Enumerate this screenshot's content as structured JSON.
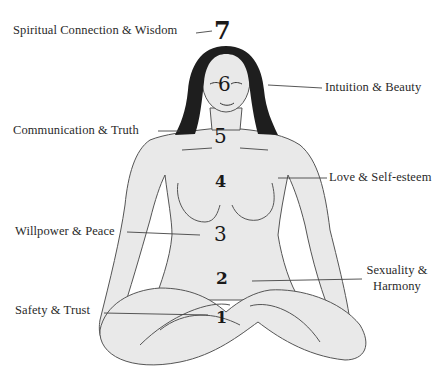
{
  "diagram": {
    "type": "chakra-body-map",
    "colors": {
      "background": "#ffffff",
      "skin": "#e9e9e9",
      "outline": "#555555",
      "hair": "#1e1e1e",
      "text": "#2a2a2a"
    },
    "chakras": [
      {
        "number": "7",
        "label": "Spiritual Connection & Wisdom"
      },
      {
        "number": "6",
        "label": "Intuition & Beauty"
      },
      {
        "number": "5",
        "label": "Communication & Truth"
      },
      {
        "number": "4",
        "label": "Love & Self-esteem"
      },
      {
        "number": "3",
        "label": "Willpower & Peace"
      },
      {
        "number": "2",
        "label_line1": "Sexuality &",
        "label_line2": "Harmony"
      },
      {
        "number": "1",
        "label": "Safety & Trust"
      }
    ]
  }
}
